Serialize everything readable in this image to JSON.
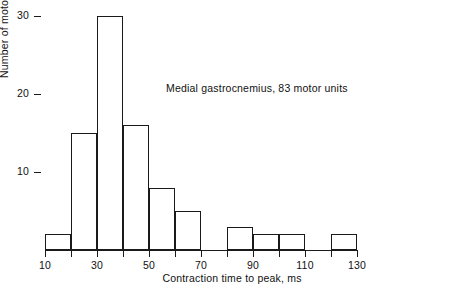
{
  "chart_data": {
    "type": "bar",
    "title": "",
    "annotation": "Medial gastrocnemius, 83 motor units",
    "xlabel": "Contraction time to peak, ms",
    "ylabel": "Number of motor units",
    "xlim": [
      10,
      130
    ],
    "ylim": [
      0,
      31
    ],
    "bin_width": 10,
    "grid": false,
    "legend": null,
    "xticks": [
      10,
      30,
      50,
      70,
      90,
      110,
      130
    ],
    "xticks_all": [
      10,
      20,
      30,
      40,
      50,
      60,
      70,
      80,
      90,
      100,
      110,
      120,
      130
    ],
    "xtick_labels": [
      "10",
      "30",
      "50",
      "70",
      "90",
      "110",
      "130"
    ],
    "yticks": [
      10,
      20,
      30
    ],
    "ytick_labels": [
      "10",
      "20",
      "30"
    ],
    "bins": [
      {
        "lo": 10,
        "hi": 20,
        "value": 2
      },
      {
        "lo": 20,
        "hi": 30,
        "value": 15
      },
      {
        "lo": 30,
        "hi": 40,
        "value": 30
      },
      {
        "lo": 40,
        "hi": 50,
        "value": 16
      },
      {
        "lo": 50,
        "hi": 60,
        "value": 8
      },
      {
        "lo": 60,
        "hi": 70,
        "value": 5
      },
      {
        "lo": 70,
        "hi": 80,
        "value": 0
      },
      {
        "lo": 80,
        "hi": 90,
        "value": 3
      },
      {
        "lo": 90,
        "hi": 100,
        "value": 2
      },
      {
        "lo": 100,
        "hi": 110,
        "value": 2
      },
      {
        "lo": 110,
        "hi": 120,
        "value": 0
      },
      {
        "lo": 120,
        "hi": 130,
        "value": 2
      }
    ],
    "categories": [
      "10-20",
      "20-30",
      "30-40",
      "40-50",
      "50-60",
      "60-70",
      "70-80",
      "80-90",
      "90-100",
      "100-110",
      "110-120",
      "120-130"
    ],
    "values": [
      2,
      15,
      30,
      16,
      8,
      5,
      0,
      3,
      2,
      2,
      0,
      2
    ],
    "colors": {
      "line": "#1a1a1a",
      "fill": "#ffffff",
      "background": "#ffffff"
    }
  }
}
